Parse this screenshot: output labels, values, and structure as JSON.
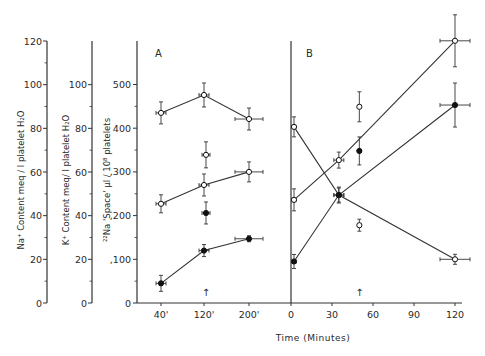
{
  "chart_data": {
    "type": "line",
    "title": "",
    "xlabel": "Time (Minutes)",
    "panels": [
      {
        "label": "A",
        "x_ticks": [
          "40'",
          "120'",
          "200'"
        ],
        "x": [
          40,
          120,
          200
        ],
        "series": [
          {
            "name": "upper open circles",
            "marker": "open",
            "values": [
              435,
              476,
              421
            ],
            "axis": "22Na space"
          },
          {
            "name": "middle open circles",
            "marker": "open",
            "values": [
              227,
              270,
              300
            ],
            "axis": "22Na space"
          },
          {
            "name": "filled circles",
            "marker": "filled",
            "values": [
              45,
              120,
              147
            ],
            "axis": "22Na space"
          }
        ],
        "isolated_points": [
          {
            "x": 120,
            "value": 339,
            "marker": "open"
          },
          {
            "x": 120,
            "value": 206,
            "marker": "filled"
          }
        ],
        "arrow_at": "120'"
      },
      {
        "label": "B",
        "x_ticks": [
          "0",
          "30",
          "60",
          "90",
          "120"
        ],
        "x": [
          0,
          35,
          120
        ],
        "series": [
          {
            "name": "descending open",
            "marker": "open",
            "values": [
              403,
              247,
              100
            ]
          },
          {
            "name": "ascending open",
            "marker": "open",
            "values": [
              236,
              327,
              600
            ]
          },
          {
            "name": "ascending filled",
            "marker": "filled",
            "values": [
              95,
              247,
              453
            ]
          }
        ],
        "isolated_points": [
          {
            "x": 50,
            "value": 449,
            "marker": "open"
          },
          {
            "x": 50,
            "value": 348,
            "marker": "filled"
          },
          {
            "x": 50,
            "value": 178,
            "marker": "open"
          }
        ],
        "arrow_at": 50
      }
    ],
    "y_axes": [
      {
        "label": "Na+ Content meq/l platelet H2O",
        "ticks": [
          0,
          20,
          40,
          60,
          80,
          100,
          120
        ],
        "ylim": [
          0,
          120
        ]
      },
      {
        "label": "K+ Content meq/l platelet H2O",
        "ticks": [
          0,
          20,
          40,
          60,
          80,
          100
        ],
        "ylim": [
          0,
          120
        ]
      },
      {
        "label": "22Na 'Space' µl/10^8 platelets",
        "ticks": [
          0,
          100,
          200,
          300,
          400,
          500
        ],
        "ylim": [
          0,
          600
        ]
      }
    ],
    "grid": false,
    "legend": null
  },
  "labels": {
    "panel_a": "A",
    "panel_b": "B",
    "xlabel": "Time (Minutes)",
    "y1": "Na⁺ Content  meq / l  platelet  H₂O",
    "y2": "K⁺ Content  meq/ l  platelet  H₂O",
    "y3": "²²Na  'Space'   µl / 10⁸ platelets",
    "arrow": "↑"
  }
}
